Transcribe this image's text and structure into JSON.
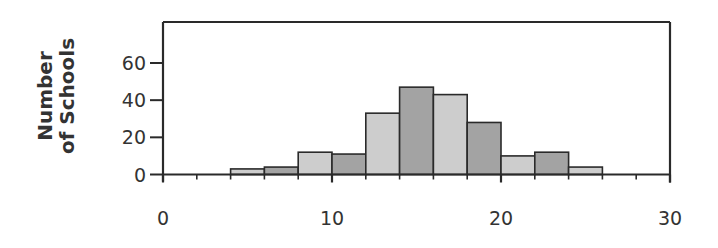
{
  "chart_data": {
    "type": "bar",
    "subtype": "histogram",
    "title": "",
    "xlabel": "",
    "ylabel": "Number of Schools",
    "ylabel_lines": [
      "Number",
      "of Schools"
    ],
    "xlim": [
      0,
      30
    ],
    "ylim": [
      0,
      75
    ],
    "x_ticks": [
      0,
      10,
      20,
      30
    ],
    "x_tick_labels": [
      "0",
      "10",
      "20",
      "30"
    ],
    "x_minor_ticks": [
      2,
      4,
      6,
      8,
      12,
      14,
      16,
      18,
      22,
      24,
      26,
      28
    ],
    "y_ticks": [
      0,
      20,
      40,
      60
    ],
    "y_tick_labels": [
      "0",
      "20",
      "40",
      "60"
    ],
    "grid": false,
    "legend": null,
    "bin_width": 2,
    "bins": [
      {
        "start": 4,
        "end": 6,
        "count": 3,
        "shade": "light"
      },
      {
        "start": 6,
        "end": 8,
        "count": 4,
        "shade": "dark"
      },
      {
        "start": 8,
        "end": 10,
        "count": 12,
        "shade": "light"
      },
      {
        "start": 10,
        "end": 12,
        "count": 11,
        "shade": "dark"
      },
      {
        "start": 12,
        "end": 14,
        "count": 33,
        "shade": "light"
      },
      {
        "start": 14,
        "end": 16,
        "count": 47,
        "shade": "dark"
      },
      {
        "start": 16,
        "end": 18,
        "count": 43,
        "shade": "light"
      },
      {
        "start": 18,
        "end": 20,
        "count": 28,
        "shade": "dark"
      },
      {
        "start": 20,
        "end": 22,
        "count": 10,
        "shade": "light"
      },
      {
        "start": 22,
        "end": 24,
        "count": 12,
        "shade": "dark"
      },
      {
        "start": 24,
        "end": 26,
        "count": 4,
        "shade": "light"
      }
    ],
    "categories": [
      "4-6",
      "6-8",
      "8-10",
      "10-12",
      "12-14",
      "14-16",
      "16-18",
      "18-20",
      "20-22",
      "22-24",
      "24-26"
    ],
    "values": [
      3,
      4,
      12,
      11,
      33,
      47,
      43,
      28,
      10,
      12,
      4
    ]
  },
  "colors": {
    "light_bar": "#cdcdcd",
    "dark_bar": "#a3a3a3",
    "axis": "#2a2a2a",
    "text": "#333333"
  }
}
